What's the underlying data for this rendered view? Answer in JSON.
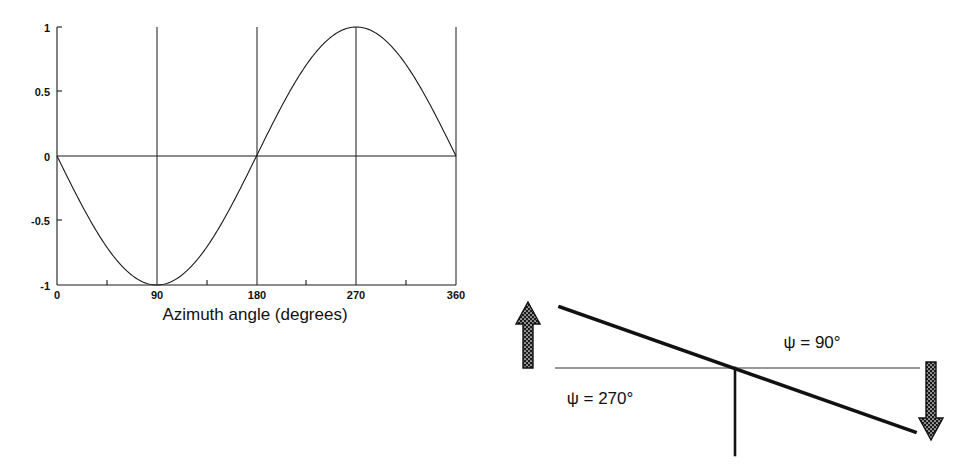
{
  "figure": {
    "background_color": "#ffffff",
    "ink_color": "#111111"
  },
  "chart_data": {
    "type": "line",
    "title": "",
    "subtitle": "",
    "xlabel": "Azimuth angle (degrees)",
    "ylabel": "",
    "xlim": [
      0,
      360
    ],
    "ylim": [
      -1,
      1
    ],
    "xticks": [
      0,
      90,
      180,
      270,
      360
    ],
    "xticklabels": [
      "0",
      "90",
      "180",
      "270",
      "360"
    ],
    "yticks": [
      -1,
      -0.5,
      0,
      0.5,
      1
    ],
    "yticklabels": [
      "-1",
      "-0.5",
      "0",
      "0.5",
      "1"
    ],
    "grid": "vertical gridlines at 90, 180, 270 and at 0 and 360 borders; horizontal rules at y = 0 and y = -1",
    "legend": "none",
    "series": [
      {
        "name": "-sin(azimuth)",
        "formula": "y = -sin(azimuth)",
        "x": [
          0,
          15,
          30,
          45,
          60,
          75,
          90,
          105,
          120,
          135,
          150,
          165,
          180,
          195,
          210,
          225,
          240,
          255,
          270,
          285,
          300,
          315,
          330,
          345,
          360
        ],
        "values": [
          0,
          -0.259,
          -0.5,
          -0.707,
          -0.866,
          -0.966,
          -1,
          -0.966,
          -0.866,
          -0.707,
          -0.5,
          -0.259,
          0,
          0.259,
          0.5,
          0.707,
          0.866,
          0.966,
          1,
          0.966,
          0.866,
          0.707,
          0.5,
          0.259,
          0
        ]
      }
    ],
    "annotations": [
      {
        "label": "minimum",
        "x": 90,
        "y": -1
      },
      {
        "label": "zero crossing",
        "x": 180,
        "y": 0
      },
      {
        "label": "maximum",
        "x": 270,
        "y": 1
      }
    ]
  },
  "chart": {
    "name": "azimuth-angle-plot",
    "x_axis_title": "Azimuth angle (degrees)",
    "x_tick_labels": [
      "0",
      "90",
      "180",
      "270",
      "360"
    ],
    "y_tick_labels": [
      "1",
      "0.5",
      "0",
      "-0.5",
      "-1"
    ]
  },
  "diagram": {
    "name": "beam-tilt-diagram",
    "labels": {
      "right": "ψ = 90°",
      "left": "ψ = 270°"
    },
    "arrows": {
      "up": "up-arrow",
      "down": "down-arrow"
    },
    "elements": {
      "horizontal_reference": "horizontal reference line",
      "tilted_beam": "tilted beam line",
      "vertical_stem": "vertical stem line"
    }
  }
}
